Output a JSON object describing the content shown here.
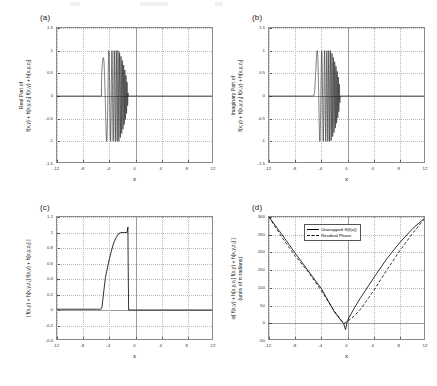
{
  "figure": {
    "panels": [
      {
        "tag": "(a)",
        "ylabel_line1": "Real Part of",
        "ylabel_line2": "f(x,y) + h[x,y,z₁] f(x,y) + h[x,y,z₂]",
        "xlabel": "x",
        "yticks": [
          "1.5",
          "1",
          "0.5",
          "0",
          "-0.5",
          "-1",
          "-1.5"
        ],
        "ytick_values": [
          1.5,
          1,
          0.5,
          0,
          -0.5,
          -1,
          -1.5
        ],
        "xticks": [
          "-12",
          "-8",
          "-4",
          "0",
          "4",
          "8",
          "12"
        ],
        "xtick_values": [
          -12,
          -8,
          -4,
          0,
          4,
          8,
          12
        ]
      },
      {
        "tag": "(b)",
        "ylabel_line1": "Imaginary Part of",
        "ylabel_line2": "f(x,y) + h[x,y,z₁] f(x,y) + h[x,y,z₂]",
        "xlabel": "x",
        "yticks": [
          "1.5",
          "1",
          "0.5",
          "0",
          "-0.5",
          "-1",
          "-1.5"
        ],
        "ytick_values": [
          1.5,
          1,
          0.5,
          0,
          -0.5,
          -1,
          -1.5
        ],
        "xticks": [
          "-12",
          "-8",
          "-4",
          "0",
          "4",
          "8",
          "12"
        ],
        "xtick_values": [
          -12,
          -8,
          -4,
          0,
          4,
          8,
          12
        ]
      },
      {
        "tag": "(c)",
        "ylabel_line1": "| f(x,y) + h[x,y,z₁] f(x,y) + h[x,y,z₂] |",
        "ylabel_line2": "",
        "xlabel": "x",
        "yticks": [
          "1.2",
          "1",
          "0.8",
          "0.6",
          "0.4",
          "0.2",
          "0",
          "-0.2",
          "-0.4"
        ],
        "ytick_values": [
          1.2,
          1,
          0.8,
          0.6,
          0.4,
          0.2,
          0,
          -0.2,
          -0.4
        ],
        "xticks": [
          "-12",
          "-8",
          "-4",
          "0",
          "4",
          "8",
          "12"
        ],
        "xtick_values": [
          -12,
          -8,
          -4,
          0,
          4,
          8,
          12
        ]
      },
      {
        "tag": "(d)",
        "ylabel_line1": "φ{ f(x,y) + h[x,y,z₁] f(x,y) + h[x,y,z₂] }",
        "ylabel_line2": "(units of π radians)",
        "xlabel": "x",
        "yticks": [
          "300",
          "250",
          "200",
          "150",
          "100",
          "50",
          "0",
          "-50"
        ],
        "ytick_values": [
          300,
          250,
          200,
          150,
          100,
          50,
          0,
          -50
        ],
        "xticks": [
          "-12",
          "-8",
          "-4",
          "0",
          "4",
          "8",
          "12"
        ],
        "xtick_values": [
          -12,
          -8,
          -4,
          0,
          4,
          8,
          12
        ],
        "legend": [
          {
            "label": "Unwrapped Φ(f(x))",
            "style": "solid"
          },
          {
            "label": "Residual Phase",
            "style": "dashed"
          }
        ]
      }
    ]
  },
  "chart_data": [
    {
      "type": "line",
      "panel": "(a)",
      "title": "",
      "xlabel": "x",
      "ylabel": "Real Part of f(x,y) + h[x,y,z1] f(x,y) + h[x,y,z2]",
      "xlim": [
        -12,
        12
      ],
      "ylim": [
        -1.5,
        1.5
      ],
      "grid": true,
      "description": "Zero baseline outside [-5.2, -1.1]; inside, an up-chirp oscillation whose envelope grows from 0 at x=-5.2 to +/-1 near x=-1.5 and whose frequency increases rapidly toward x=-1.1",
      "series": [
        {
          "name": "Real part",
          "style": "solid",
          "chirp": {
            "x_start": -5.2,
            "x_end": -1.12,
            "envelope_max": 1.0,
            "phase_coefficient": 26.0,
            "phase_power": 2.0,
            "component": "cos"
          }
        }
      ]
    },
    {
      "type": "line",
      "panel": "(b)",
      "title": "",
      "xlabel": "x",
      "ylabel": "Imaginary Part of f(x,y) + h[x,y,z1] f(x,y) + h[x,y,z2]",
      "xlim": [
        -12,
        12
      ],
      "ylim": [
        -1.5,
        1.5
      ],
      "grid": true,
      "description": "Same chirp as panel (a) but 90 degrees out of phase (sine component)",
      "series": [
        {
          "name": "Imaginary part",
          "style": "solid",
          "chirp": {
            "x_start": -5.2,
            "x_end": -1.12,
            "envelope_max": 1.0,
            "phase_coefficient": 26.0,
            "phase_power": 2.0,
            "component": "sin"
          }
        }
      ]
    },
    {
      "type": "line",
      "panel": "(c)",
      "title": "",
      "xlabel": "x",
      "ylabel": "| f(x,y) + h[x,y,z1] f(x,y) + h[x,y,z2] |",
      "xlim": [
        -12,
        12
      ],
      "ylim": [
        -0.4,
        1.2
      ],
      "grid": true,
      "description": "Magnitude envelope: ~0 for x < -5.2, rises steeply then rolls over to a flat plateau at 1.0 between about x=-2.6 and x=-1.15, small spike to 1.07 at x=-1.15, then drops abruptly to 0 and stays 0 for x > -1.1",
      "x": [
        -12,
        -6,
        -5.3,
        -5.15,
        -4.6,
        -4.0,
        -3.4,
        -3.0,
        -2.6,
        -2.2,
        -1.7,
        -1.3,
        -1.16,
        -1.12,
        -1.05,
        0,
        6,
        12
      ],
      "y": [
        0.01,
        0.01,
        0.01,
        0.02,
        0.42,
        0.66,
        0.85,
        0.93,
        0.985,
        1.0,
        1.0,
        1.0,
        1.07,
        0.6,
        0.0,
        0.0,
        0.0,
        0.0
      ]
    },
    {
      "type": "line",
      "panel": "(d)",
      "title": "",
      "xlabel": "x",
      "ylabel": "φ{ f(x,y) + h[x,y,z1] f(x,y) + h[x,y,z2] } (units of π radians)",
      "xlim": [
        -12,
        12
      ],
      "ylim": [
        -50,
        300
      ],
      "grid": true,
      "legend_position": "top-center",
      "series": [
        {
          "name": "Unwrapped Φ(f(x))",
          "style": "solid",
          "x": [
            -12,
            -10,
            -8,
            -6,
            -4,
            -2,
            -1,
            -0.6,
            -0.3,
            0,
            1,
            2,
            4,
            6,
            8,
            10,
            12
          ],
          "y": [
            300,
            250,
            198,
            148,
            98,
            32,
            8,
            0,
            -18,
            8,
            42,
            72,
            128,
            182,
            228,
            268,
            300
          ]
        },
        {
          "name": "Residual Phase",
          "style": "dashed",
          "x": [
            -12,
            -10,
            -8,
            -6,
            -4,
            -2,
            -1,
            -0.5,
            0,
            1,
            2,
            4,
            6,
            8,
            10,
            12
          ],
          "y": [
            300,
            242,
            190,
            145,
            92,
            34,
            10,
            0,
            6,
            20,
            40,
            92,
            150,
            205,
            255,
            300
          ]
        }
      ]
    }
  ]
}
